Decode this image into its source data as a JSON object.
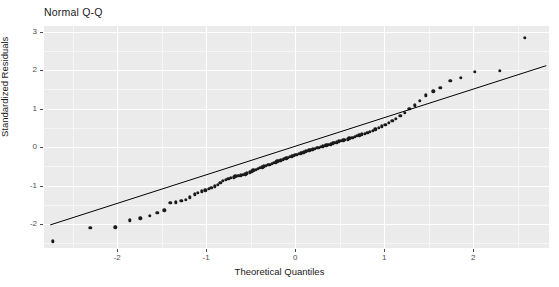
{
  "chart_data": {
    "type": "scatter",
    "title": "Normal Q-Q",
    "xlabel": "Theoretical Quantiles",
    "ylabel": "Standardized Residuals",
    "xlim": [
      -2.82,
      2.85
    ],
    "ylim": [
      -2.62,
      3.15
    ],
    "xticks": [
      -2,
      -1,
      0,
      1,
      2
    ],
    "xticklabels": [
      "-2",
      "-1",
      "0",
      "1",
      "2"
    ],
    "yticks": [
      -2,
      -1,
      0,
      1,
      2,
      3
    ],
    "yticklabels": [
      "-2",
      "-1",
      "0",
      "1",
      "2",
      "3"
    ],
    "grid": true,
    "legend": false,
    "panel_background": "#ebebeb",
    "grid_color": "#ffffff",
    "point_color": "#1a1a1a",
    "line_color": "#000000",
    "reference_line": {
      "label": "qq-reference-line",
      "x": [
        -2.75,
        2.82
      ],
      "y": [
        -2.02,
        2.12
      ]
    },
    "series": [
      {
        "name": "standardized-residuals",
        "x": [
          -2.72,
          -2.3,
          -2.02,
          -1.86,
          -1.74,
          -1.63,
          -1.55,
          -1.47,
          -1.4,
          -1.34,
          -1.28,
          -1.23,
          -1.18,
          -1.13,
          -1.09,
          -1.05,
          -1.01,
          -0.97,
          -0.94,
          -0.9,
          -0.87,
          -0.84,
          -0.81,
          -0.78,
          -0.75,
          -0.72,
          -0.69,
          -0.67,
          -0.64,
          -0.61,
          -0.59,
          -0.56,
          -0.54,
          -0.51,
          -0.49,
          -0.47,
          -0.44,
          -0.42,
          -0.4,
          -0.37,
          -0.35,
          -0.33,
          -0.31,
          -0.29,
          -0.26,
          -0.24,
          -0.22,
          -0.2,
          -0.18,
          -0.16,
          -0.14,
          -0.12,
          -0.1,
          -0.08,
          -0.06,
          -0.04,
          -0.02,
          0.0,
          0.02,
          0.04,
          0.06,
          0.08,
          0.1,
          0.12,
          0.14,
          0.16,
          0.18,
          0.2,
          0.22,
          0.24,
          0.26,
          0.29,
          0.31,
          0.33,
          0.35,
          0.37,
          0.4,
          0.42,
          0.44,
          0.47,
          0.49,
          0.51,
          0.54,
          0.56,
          0.59,
          0.61,
          0.64,
          0.67,
          0.69,
          0.72,
          0.75,
          0.78,
          0.81,
          0.84,
          0.87,
          0.9,
          0.94,
          0.97,
          1.01,
          1.05,
          1.09,
          1.13,
          1.18,
          1.23,
          1.28,
          1.34,
          1.4,
          1.47,
          1.55,
          1.63,
          1.74,
          1.86,
          2.02,
          2.3,
          2.58
        ],
        "y": [
          -2.45,
          -2.1,
          -2.08,
          -1.9,
          -1.85,
          -1.78,
          -1.7,
          -1.64,
          -1.45,
          -1.43,
          -1.4,
          -1.36,
          -1.3,
          -1.22,
          -1.18,
          -1.15,
          -1.12,
          -1.08,
          -1.05,
          -1.02,
          -0.98,
          -0.92,
          -0.88,
          -0.85,
          -0.82,
          -0.8,
          -0.78,
          -0.76,
          -0.74,
          -0.73,
          -0.72,
          -0.7,
          -0.68,
          -0.65,
          -0.63,
          -0.6,
          -0.58,
          -0.56,
          -0.54,
          -0.52,
          -0.5,
          -0.48,
          -0.46,
          -0.45,
          -0.43,
          -0.41,
          -0.39,
          -0.37,
          -0.36,
          -0.34,
          -0.32,
          -0.3,
          -0.29,
          -0.27,
          -0.25,
          -0.24,
          -0.22,
          -0.2,
          -0.19,
          -0.17,
          -0.16,
          -0.14,
          -0.13,
          -0.11,
          -0.1,
          -0.08,
          -0.07,
          -0.05,
          -0.04,
          -0.02,
          -0.01,
          0.01,
          0.02,
          0.04,
          0.05,
          0.07,
          0.08,
          0.1,
          0.11,
          0.13,
          0.15,
          0.16,
          0.18,
          0.2,
          0.21,
          0.23,
          0.25,
          0.27,
          0.29,
          0.31,
          0.33,
          0.35,
          0.38,
          0.4,
          0.43,
          0.46,
          0.5,
          0.54,
          0.58,
          0.63,
          0.68,
          0.74,
          0.81,
          0.9,
          0.99,
          1.09,
          1.21,
          1.35,
          1.45,
          1.55,
          1.73,
          1.8,
          1.96,
          1.98,
          2.85
        ]
      }
    ]
  }
}
